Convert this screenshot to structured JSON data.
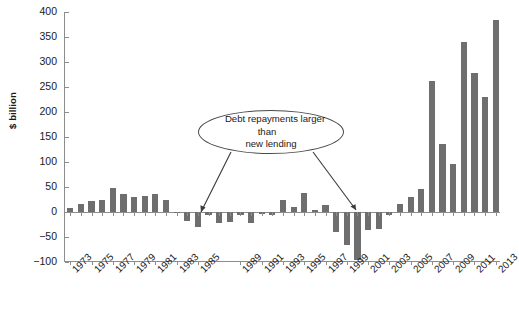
{
  "chart_data": {
    "type": "bar",
    "title": "",
    "subtitle": "",
    "xlabel": "",
    "ylabel": "$ billion",
    "ylim": [
      -100,
      400
    ],
    "ytick_values": [
      400,
      350,
      300,
      250,
      200,
      150,
      100,
      50,
      0,
      -50,
      -100
    ],
    "ytick_labels": [
      "400",
      "350",
      "300",
      "250",
      "200",
      "150",
      "100",
      "50",
      "0",
      "−50",
      "−100"
    ],
    "xtick_labels": [
      "1973",
      "1975",
      "1977",
      "1979",
      "1981",
      "1983",
      "1985",
      "1989",
      "1991",
      "1993",
      "1995",
      "1997",
      "1999",
      "2001",
      "2003",
      "2005",
      "2007",
      "2009",
      "2011",
      "2013"
    ],
    "grid": false,
    "legend": null,
    "bar_color": "#6e6e6e",
    "axis_color": "#8d8d8d",
    "categories": [
      "1973",
      "1974",
      "1975",
      "1976",
      "1977",
      "1978",
      "1979",
      "1980",
      "1981",
      "1982",
      "1983",
      "1984",
      "1985",
      "1986",
      "1987",
      "1988",
      "1989",
      "1990",
      "1991",
      "1992",
      "1993",
      "1994",
      "1995",
      "1996",
      "1997",
      "1998",
      "1999",
      "2000",
      "2001",
      "2002",
      "2003",
      "2004",
      "2005",
      "2006",
      "2007",
      "2008",
      "2009",
      "2010",
      "2011",
      "2012",
      "2013"
    ],
    "values": [
      9,
      17,
      22,
      25,
      48,
      36,
      31,
      33,
      37,
      25,
      -2,
      -18,
      -30,
      -6,
      -22,
      -20,
      -6,
      -22,
      -4,
      -6,
      25,
      11,
      38,
      5,
      14,
      -40,
      -66,
      -95,
      -35,
      -33,
      -5,
      16,
      30,
      47,
      263,
      137,
      96,
      341,
      279,
      230,
      384
    ],
    "annotations": [
      {
        "text": "Debt repayments larger than new lending",
        "line1": "Debt repayments larger than",
        "line2": "new lending",
        "points_to": [
          "1984",
          "2000"
        ]
      }
    ]
  }
}
